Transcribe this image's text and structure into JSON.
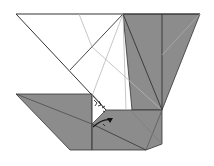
{
  "diagram": {
    "colors": {
      "paper_white": "#ffffff",
      "paper_colored": "#8c8c8c",
      "edge": "#333333",
      "crease": "#b8b8b8",
      "arrow": "#111111"
    },
    "annotations": [
      "fold arrow",
      "squash/rotate marks"
    ]
  }
}
